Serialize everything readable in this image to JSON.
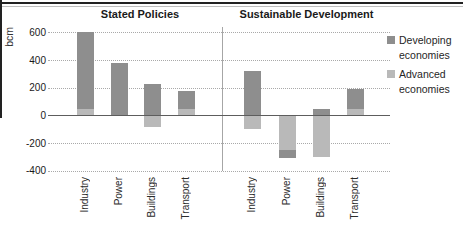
{
  "chart_data": {
    "type": "bar",
    "stacked": true,
    "title": "",
    "ylabel": "bcm",
    "ylim": [
      -400,
      600
    ],
    "yticks": [
      600,
      400,
      200,
      0,
      -200,
      -400
    ],
    "categories": [
      "Industry",
      "Power",
      "Buildings",
      "Transport"
    ],
    "panels": [
      {
        "title": "Stated Policies",
        "series": [
          {
            "name": "Developing economies",
            "values": [
              550,
              380,
              230,
              130
            ]
          },
          {
            "name": "Advanced economies",
            "values": [
              50,
              0,
              -80,
              45
            ]
          }
        ]
      },
      {
        "title": "Sustainable Development",
        "series": [
          {
            "name": "Developing economies",
            "values": [
              320,
              -55,
              50,
              145
            ]
          },
          {
            "name": "Advanced economies",
            "values": [
              -100,
              -250,
              -300,
              45
            ]
          }
        ]
      }
    ],
    "legend": [
      {
        "label": "Developing economies",
        "color": "#8e8e8e"
      },
      {
        "label": "Advanced economies",
        "color": "#b9b9b9"
      }
    ],
    "legend_position": "right",
    "grid": "horizontal-dotted"
  },
  "colors": {
    "developing": "#8e8e8e",
    "advanced": "#b9b9b9",
    "zero_axis": "#5d5d5d",
    "gridline": "#a9a9a9",
    "border": "#222222"
  }
}
